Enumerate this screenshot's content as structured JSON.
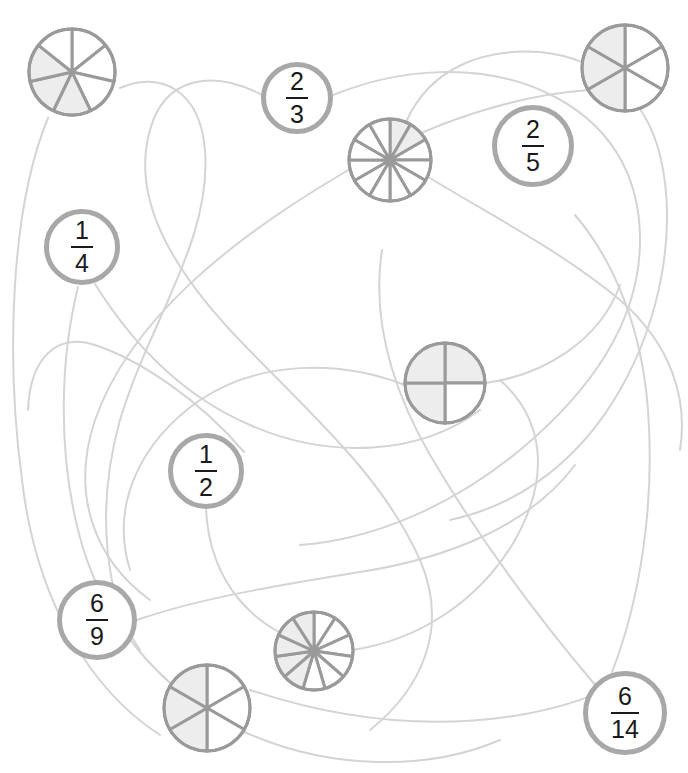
{
  "page": {
    "width": 688,
    "height": 773,
    "background_color": "#ffffff"
  },
  "colors": {
    "circle_stroke": "#a8a8a8",
    "pie_stroke": "#9a9a9a",
    "pie_shaded_fill": "#ededed",
    "pie_empty_fill": "#ffffff",
    "curve_stroke": "#d4d4d4",
    "text_color": "#1a1a1a"
  },
  "fraction_nodes": [
    {
      "id": "frac-2-3",
      "numerator": "2",
      "denominator": "3",
      "cx": 297,
      "cy": 98,
      "r": 36,
      "stroke_width": 5
    },
    {
      "id": "frac-2-5",
      "numerator": "2",
      "denominator": "5",
      "cx": 533,
      "cy": 146,
      "r": 41,
      "stroke_width": 5
    },
    {
      "id": "frac-1-4",
      "numerator": "1",
      "denominator": "4",
      "cx": 82,
      "cy": 247,
      "r": 38,
      "stroke_width": 5
    },
    {
      "id": "frac-1-2",
      "numerator": "1",
      "denominator": "2",
      "cx": 206,
      "cy": 471,
      "r": 38,
      "stroke_width": 5
    },
    {
      "id": "frac-6-9",
      "numerator": "6",
      "denominator": "9",
      "cx": 97,
      "cy": 620,
      "r": 40,
      "stroke_width": 5
    },
    {
      "id": "frac-6-14",
      "numerator": "6",
      "denominator": "14",
      "cx": 625,
      "cy": 713,
      "r": 42,
      "stroke_width": 5
    }
  ],
  "pie_nodes": [
    {
      "id": "pie-7-seg",
      "cx": 72,
      "cy": 72,
      "r": 43,
      "segments": 7,
      "shaded": [
        3,
        4,
        5
      ],
      "start_angle": -90,
      "stroke_width": 3
    },
    {
      "id": "pie-6-top",
      "cx": 625,
      "cy": 68,
      "r": 43,
      "segments": 6,
      "shaded": [
        3,
        4,
        5
      ],
      "start_angle": -90,
      "stroke_width": 3
    },
    {
      "id": "pie-12-seg",
      "cx": 390,
      "cy": 160,
      "r": 41,
      "segments": 12,
      "shaded": [
        0,
        1
      ],
      "start_angle": -90,
      "stroke_width": 3
    },
    {
      "id": "pie-4-seg",
      "cx": 445,
      "cy": 383,
      "r": 40,
      "segments": 4,
      "shaded": [
        0,
        2,
        3
      ],
      "start_angle": -90,
      "stroke_width": 3
    },
    {
      "id": "pie-11-seg",
      "cx": 314,
      "cy": 651,
      "r": 39,
      "segments": 11,
      "shaded": [
        6,
        7,
        8,
        9,
        10
      ],
      "start_angle": -90,
      "stroke_width": 3
    },
    {
      "id": "pie-6-bot",
      "cx": 207,
      "cy": 708,
      "r": 43,
      "segments": 6,
      "shaded": [
        3,
        4,
        5
      ],
      "start_angle": -90,
      "stroke_width": 3
    }
  ],
  "connector_curves": [
    {
      "id": "curve-1",
      "d": "M 48 118 C 10 210, 6 360, 22 480 C 36 600, 90 690, 160 735"
    },
    {
      "id": "curve-2",
      "d": "M 120 88 C 160 70, 200 90, 205 150 C 212 240, 150 320, 120 420 C 95 510, 105 600, 140 650"
    },
    {
      "id": "curve-3",
      "d": "M 262 95 C 215 70, 165 75, 150 130 C 130 200, 175 270, 230 330 C 300 405, 380 470, 420 560 C 450 630, 420 690, 370 730"
    },
    {
      "id": "curve-4",
      "d": "M 333 95 C 400 68, 480 62, 545 92 C 610 122, 640 175, 640 240 C 640 330, 580 400, 520 450 C 450 508, 370 540, 300 545"
    },
    {
      "id": "curve-5",
      "d": "M 95 284 C 130 340, 180 395, 250 425 C 330 460, 420 455, 480 410"
    },
    {
      "id": "curve-6",
      "d": "M 78 287 C 60 360, 58 450, 78 530 C 100 620, 160 690, 240 730 C 330 772, 430 770, 500 740"
    },
    {
      "id": "curve-7",
      "d": "M 407 120 C 430 70, 480 48, 540 52 C 600 58, 645 95, 660 155 C 678 230, 660 320, 620 390 C 580 460, 520 505, 450 520"
    },
    {
      "id": "curve-8",
      "d": "M 430 178 C 490 215, 560 250, 620 300 C 672 345, 688 400, 680 450"
    },
    {
      "id": "curve-9",
      "d": "M 588 90 C 520 95, 430 120, 340 175 C 230 240, 130 320, 95 420 C 70 495, 95 560, 150 600"
    },
    {
      "id": "curve-10",
      "d": "M 244 452 C 200 400, 140 360, 95 345 C 55 332, 30 360, 28 410"
    },
    {
      "id": "curve-11",
      "d": "M 206 510 C 210 580, 250 630, 320 648"
    },
    {
      "id": "curve-12",
      "d": "M 137 620 C 200 598, 280 585, 360 572 C 450 558, 530 525, 575 465"
    },
    {
      "id": "curve-13",
      "d": "M 596 686 C 540 620, 480 540, 430 455 C 390 385, 372 315, 382 250"
    },
    {
      "id": "curve-14",
      "d": "M 612 672 C 640 600, 655 505, 648 410 C 642 330, 615 262, 575 215"
    },
    {
      "id": "curve-15",
      "d": "M 250 690 C 340 720, 430 730, 520 715 C 580 704, 610 690, 628 672"
    },
    {
      "id": "curve-16",
      "d": "M 405 385 C 340 360, 260 360, 200 400 C 140 442, 110 505, 130 570"
    },
    {
      "id": "curve-17",
      "d": "M 485 383 C 545 375, 600 340, 620 285"
    },
    {
      "id": "curve-18",
      "d": "M 352 650 C 420 640, 480 600, 515 540 C 550 478, 545 420, 500 380"
    }
  ]
}
